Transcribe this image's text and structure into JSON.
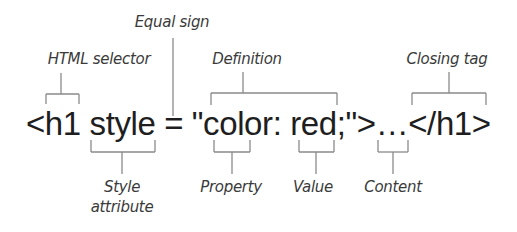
{
  "diagram": {
    "code_line": "<h1 style = \"color: red;\">…</h1>",
    "labels_above": {
      "equal_sign": "Equal sign",
      "html_selector": "HTML selector",
      "definition": "Definition",
      "closing_tag": "Closing tag"
    },
    "labels_below": {
      "style_attribute_line1": "Style",
      "style_attribute_line2": "attribute",
      "property": "Property",
      "value": "Value",
      "content": "Content"
    },
    "colors": {
      "text": "#1e1e1e",
      "label": "#3a3a3a",
      "bracket": "#8a8a8a",
      "background": "#ffffff"
    }
  }
}
